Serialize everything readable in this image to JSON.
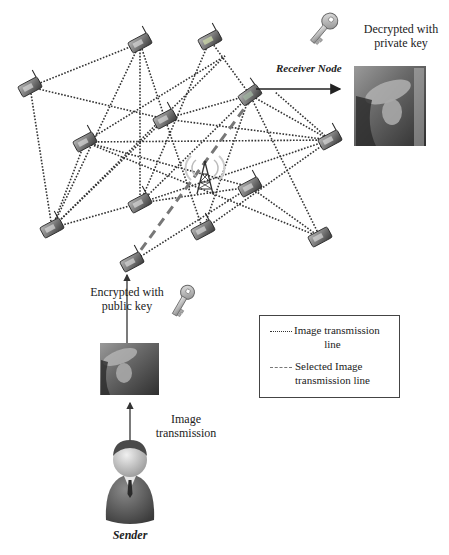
{
  "diagram": {
    "labels": {
      "receiver_node": "Receiver Node",
      "decrypted": "Decrypted with private key",
      "encrypted": "Encrypted with public key",
      "image_transmission": "Image transmission",
      "sender": "Sender"
    },
    "legend": {
      "items": [
        {
          "style": "dotted",
          "label_line1": "Image transmission",
          "label_line2": "line"
        },
        {
          "style": "dashed",
          "label_line1": "Selected Image",
          "label_line2": "transmission line"
        }
      ]
    },
    "colors": {
      "dotted_line": "#333333",
      "selected_line": "#777777",
      "arrow": "#222222",
      "node_body": "#6a6a6a",
      "background": "#ffffff"
    },
    "nodes": [
      {
        "id": "n1",
        "x": 140,
        "y": 43
      },
      {
        "id": "n2",
        "x": 30,
        "y": 87
      },
      {
        "id": "n3",
        "x": 165,
        "y": 119
      },
      {
        "id": "n4_receiver",
        "x": 250,
        "y": 95
      },
      {
        "id": "n5",
        "x": 85,
        "y": 142
      },
      {
        "id": "n6",
        "x": 210,
        "y": 40
      },
      {
        "id": "n7",
        "x": 330,
        "y": 140
      },
      {
        "id": "n8",
        "x": 52,
        "y": 228
      },
      {
        "id": "n9",
        "x": 140,
        "y": 203
      },
      {
        "id": "n10",
        "x": 203,
        "y": 230
      },
      {
        "id": "n11",
        "x": 250,
        "y": 187
      },
      {
        "id": "n12",
        "x": 320,
        "y": 237
      },
      {
        "id": "n13_sender_node",
        "x": 132,
        "y": 262
      }
    ],
    "tower": {
      "x": 205,
      "y": 178
    }
  }
}
